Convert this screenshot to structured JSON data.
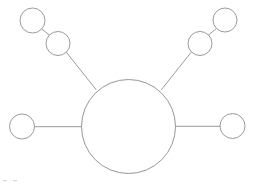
{
  "diagram": {
    "type": "node-link-diagram",
    "canvas": {
      "width": 255,
      "height": 185,
      "background_color": "#ffffff"
    },
    "style": {
      "stroke_color": "#8f8f93",
      "node_fill": "#ffffff",
      "stroke_width": 0.9
    },
    "hub": {
      "id": "hub",
      "label": "",
      "cx": 128.5,
      "cy": 126.5,
      "r": 47
    },
    "nodes": [
      {
        "id": "left-outer",
        "label": "",
        "cx": 22.0,
        "cy": 126.5,
        "r": 12.5
      },
      {
        "id": "right-outer",
        "label": "",
        "cx": 232.5,
        "cy": 126.0,
        "r": 12.5
      },
      {
        "id": "upper-left-inner",
        "label": "",
        "cx": 58.0,
        "cy": 43.5,
        "r": 12.0
      },
      {
        "id": "upper-left-outer",
        "label": "",
        "cx": 32.5,
        "cy": 20.5,
        "r": 12.5
      },
      {
        "id": "upper-right-inner",
        "label": "",
        "cx": 200.0,
        "cy": 43.5,
        "r": 12.0
      },
      {
        "id": "upper-right-outer",
        "label": "",
        "cx": 225.0,
        "cy": 20.0,
        "r": 12.0
      }
    ],
    "edges": [
      {
        "id": "edge-hub-left",
        "from": "hub",
        "to": "left-outer",
        "x1": 81.5,
        "y1": 126.7,
        "x2": 34.5,
        "y2": 126.7
      },
      {
        "id": "edge-hub-right",
        "from": "hub",
        "to": "right-outer",
        "x1": 175.5,
        "y1": 126.3,
        "x2": 220.0,
        "y2": 126.3
      },
      {
        "id": "edge-hub-upleft",
        "from": "hub",
        "to": "upper-left-inner",
        "x1": 96.0,
        "y1": 89.5,
        "x2": 66.5,
        "y2": 52.5
      },
      {
        "id": "edge-upleft-chain",
        "from": "upper-left-inner",
        "to": "upper-left-outer",
        "x1": 49.5,
        "y1": 35.0,
        "x2": 41.0,
        "y2": 28.5
      },
      {
        "id": "edge-hub-upright",
        "from": "hub",
        "to": "upper-right-inner",
        "x1": 161.5,
        "y1": 89.5,
        "x2": 191.0,
        "y2": 52.5
      },
      {
        "id": "edge-upright-chain",
        "from": "upper-right-inner",
        "to": "upper-right-outer",
        "x1": 208.5,
        "y1": 35.0,
        "x2": 216.5,
        "y2": 28.5
      }
    ],
    "corner_marks": [
      {
        "id": "corner-mark-1",
        "x": 3.0,
        "y": 180.0,
        "w": 4.0,
        "h": 1.2
      },
      {
        "id": "corner-mark-2",
        "x": 13.0,
        "y": 180.0,
        "w": 4.0,
        "h": 1.2
      }
    ]
  }
}
